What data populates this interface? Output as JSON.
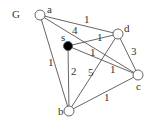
{
  "graph_label": "G",
  "nodes": [
    {
      "id": "a",
      "label": "a",
      "x": 40,
      "y": 15,
      "filled": false,
      "lx": 47,
      "ly": 13
    },
    {
      "id": "d",
      "label": "d",
      "x": 118,
      "y": 34,
      "filled": false,
      "lx": 124,
      "ly": 32
    },
    {
      "id": "s",
      "label": "s",
      "x": 68,
      "y": 46,
      "filled": true,
      "lx": 61,
      "ly": 41
    },
    {
      "id": "c",
      "label": "c",
      "x": 138,
      "y": 75,
      "filled": false,
      "lx": 136,
      "ly": 90
    },
    {
      "id": "b",
      "label": "b",
      "x": 69,
      "y": 111,
      "filled": false,
      "lx": 58,
      "ly": 115
    }
  ],
  "edges": [
    {
      "from": "a",
      "to": "d",
      "weight": "1",
      "lx": 84,
      "ly": 23
    },
    {
      "from": "a",
      "to": "c",
      "weight": "4",
      "lx": 72,
      "ly": 34
    },
    {
      "from": "a",
      "to": "b",
      "weight": "1",
      "lx": 48,
      "ly": 66
    },
    {
      "from": "s",
      "to": "d",
      "weight": "1",
      "lx": 97,
      "ly": 41
    },
    {
      "from": "s",
      "to": "c",
      "weight": "1",
      "lx": 90,
      "ly": 56
    },
    {
      "from": "s",
      "to": "b",
      "weight": "2",
      "lx": 71,
      "ly": 75
    },
    {
      "from": "d",
      "to": "b",
      "weight": "5",
      "lx": 88,
      "ly": 76
    },
    {
      "from": "d",
      "to": "c",
      "weight": "3",
      "lx": 131,
      "ly": 55
    },
    {
      "from": "b",
      "to": "c",
      "weight": "1",
      "lx": 104,
      "ly": 101
    },
    {
      "from": "a",
      "to": "c",
      "weight": "1",
      "lx": 110,
      "ly": 73,
      "label_only": true
    }
  ],
  "colors": {
    "edge": "#555555",
    "node_stroke": "#555555",
    "node_fill": "#ffffff",
    "source_fill": "#000000",
    "text": "#333333"
  }
}
